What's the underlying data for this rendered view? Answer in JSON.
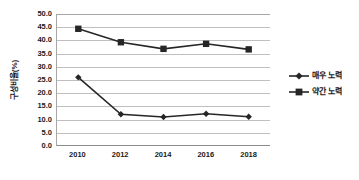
{
  "chart_data": {
    "type": "line",
    "title": "",
    "xlabel": "",
    "ylabel": "구성비율(%)",
    "categories": [
      "2010",
      "2012",
      "2014",
      "2016",
      "2018"
    ],
    "x": [
      2010,
      2012,
      2014,
      2016,
      2018
    ],
    "ylim": [
      0.0,
      50.0
    ],
    "ytick_step": 5.0,
    "ytick_labels": [
      "50.0",
      "45.0",
      "40.0",
      "35.0",
      "30.0",
      "25.0",
      "20.0",
      "15.0",
      "10.0",
      "5.0",
      "0.0"
    ],
    "ytick_values": [
      50.0,
      45.0,
      40.0,
      35.0,
      30.0,
      25.0,
      20.0,
      15.0,
      10.0,
      5.0,
      0.0
    ],
    "grid": true,
    "legend_position": "right",
    "series": [
      {
        "name": "매우 노력",
        "marker": "diamond",
        "color": "#262626",
        "values": [
          26.0,
          12.0,
          11.0,
          12.2,
          11.1
        ]
      },
      {
        "name": "약간 노력",
        "marker": "square",
        "color": "#262626",
        "values": [
          44.4,
          39.3,
          36.8,
          38.7,
          36.6
        ]
      }
    ]
  },
  "colors": {
    "line": "#262626",
    "gridline": "#bfbfbf",
    "axis": "#8c8c8c",
    "text": "#1a1a1a",
    "background": "#ffffff"
  }
}
